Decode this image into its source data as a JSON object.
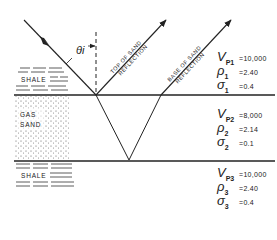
{
  "diagram": {
    "angle_label": "θi",
    "ray_labels": {
      "top": "TOP OF SAND REFLECTION",
      "top_line1": "TOP OF SAND",
      "top_line2": "REFLECTION",
      "base_line1": "BASE OF SAND",
      "base_line2": "REFLECTION"
    },
    "layers": [
      {
        "name": "SHALE",
        "label_line1": "SHALE",
        "label_line2": "",
        "vp_symbol": "V",
        "vp_sub": "P1",
        "vp": "=10,000",
        "rho_symbol": "ρ",
        "rho_sub": "1",
        "rho": "=2.40",
        "sigma_symbol": "σ",
        "sigma_sub": "1",
        "sigma": "=0.4"
      },
      {
        "name": "GAS SAND",
        "label_line1": "GAS",
        "label_line2": "SAND",
        "vp_symbol": "V",
        "vp_sub": "P2",
        "vp": "=8,000",
        "rho_symbol": "ρ",
        "rho_sub": "2",
        "rho": "=2.14",
        "sigma_symbol": "σ",
        "sigma_sub": "2",
        "sigma": "=0.1"
      },
      {
        "name": "SHALE",
        "label_line1": "SHALE",
        "label_line2": "",
        "vp_symbol": "V",
        "vp_sub": "P3",
        "vp": "=10,000",
        "rho_symbol": "ρ",
        "rho_sub": "3",
        "rho": "=2.40",
        "sigma_symbol": "σ",
        "sigma_sub": "3",
        "sigma": "=0.4"
      }
    ]
  }
}
